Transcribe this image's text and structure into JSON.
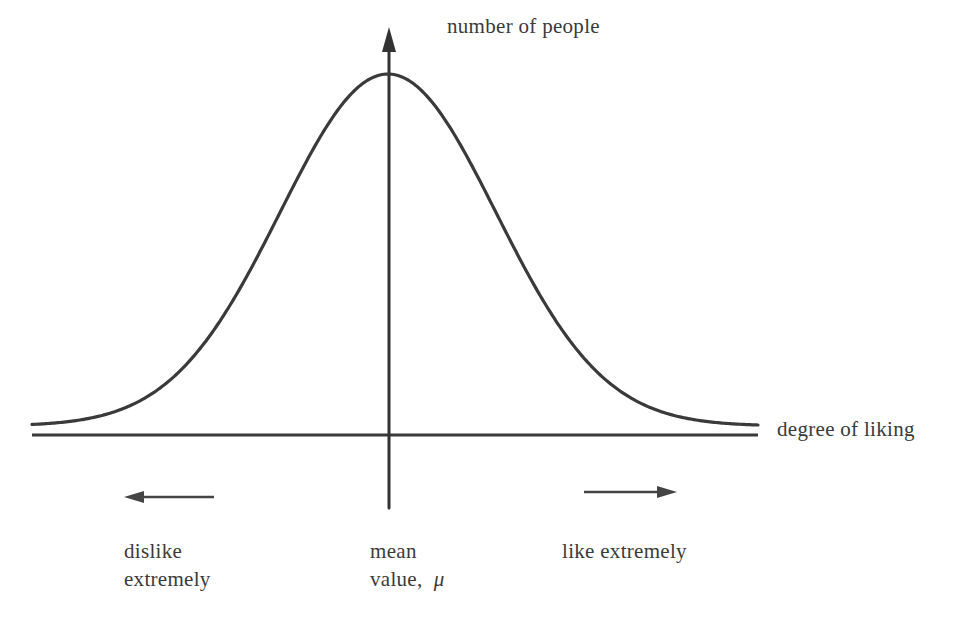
{
  "chart_data": {
    "type": "line",
    "title": "",
    "xlabel": "degree of liking",
    "ylabel": "number of people",
    "curve": "gaussian",
    "mean_label": "mean value, μ",
    "x_direction_labels": {
      "left": "dislike extremely",
      "right": "like extremely"
    },
    "grid": false,
    "legend": null,
    "approx_points_normalized": {
      "x_sigma": [
        -3.4,
        -3,
        -2,
        -1,
        0,
        1,
        2,
        3,
        3.4
      ],
      "y_relative": [
        0.003,
        0.011,
        0.135,
        0.607,
        1.0,
        0.607,
        0.135,
        0.011,
        0.003
      ]
    }
  },
  "labels": {
    "y_axis": "number of people",
    "x_axis": "degree of liking",
    "left_line1": "dislike",
    "left_line2": "extremely",
    "center_line1": "mean",
    "center_line2": "value,",
    "center_symbol": "μ",
    "right": "like extremely"
  },
  "colors": {
    "ink": "#333333",
    "background": "#ffffff"
  }
}
